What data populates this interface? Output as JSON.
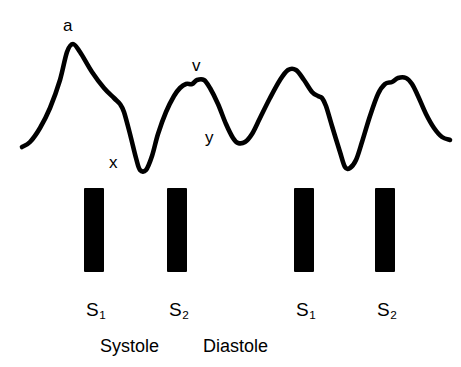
{
  "figure": {
    "type": "jugular-venous-pulse-waveform",
    "width": 461,
    "height": 367,
    "background_color": "#ffffff",
    "stroke_color": "#000000"
  },
  "wave_labels": [
    {
      "id": "a-wave",
      "text": "a",
      "x": 63,
      "y": 17
    },
    {
      "id": "x-descent",
      "text": "x",
      "x": 109,
      "y": 154
    },
    {
      "id": "v-wave",
      "text": "v",
      "x": 192,
      "y": 57
    },
    {
      "id": "y-descent",
      "text": "y",
      "x": 205,
      "y": 129
    }
  ],
  "heart_sounds": [
    {
      "id": "s1-first",
      "label": "S",
      "subscript": "1",
      "bar_x": 84,
      "bar_y": 188,
      "label_x": 86,
      "label_y": 300
    },
    {
      "id": "s2-first",
      "label": "S",
      "subscript": "2",
      "bar_x": 167,
      "bar_y": 188,
      "label_x": 169,
      "label_y": 300
    },
    {
      "id": "s1-second",
      "label": "S",
      "subscript": "1",
      "bar_x": 294,
      "bar_y": 188,
      "label_x": 296,
      "label_y": 300
    },
    {
      "id": "s2-second",
      "label": "S",
      "subscript": "2",
      "bar_x": 375,
      "bar_y": 188,
      "label_x": 377,
      "label_y": 300
    }
  ],
  "phases": [
    {
      "id": "systole",
      "text": "Systole",
      "x": 100,
      "y": 337
    },
    {
      "id": "diastole",
      "text": "Diastole",
      "x": 203,
      "y": 337
    }
  ],
  "chart_data": {
    "type": "line",
    "title": "",
    "xlabel": "",
    "ylabel": "",
    "grid": false,
    "legend": "none",
    "xlim": [
      0,
      461
    ],
    "ylim": [
      180,
      0
    ],
    "series": [
      {
        "name": "jugular-venous-pulse",
        "points": [
          [
            22,
            147
          ],
          [
            30,
            142
          ],
          [
            40,
            128
          ],
          [
            50,
            108
          ],
          [
            60,
            80
          ],
          [
            67,
            52
          ],
          [
            73,
            44
          ],
          [
            80,
            52
          ],
          [
            92,
            72
          ],
          [
            104,
            88
          ],
          [
            114,
            98
          ],
          [
            120,
            104
          ],
          [
            124,
            112
          ],
          [
            130,
            134
          ],
          [
            136,
            158
          ],
          [
            140,
            170
          ],
          [
            146,
            170
          ],
          [
            152,
            156
          ],
          [
            158,
            134
          ],
          [
            166,
            112
          ],
          [
            174,
            96
          ],
          [
            180,
            88
          ],
          [
            186,
            84
          ],
          [
            192,
            84
          ],
          [
            197,
            80
          ],
          [
            204,
            80
          ],
          [
            210,
            88
          ],
          [
            218,
            104
          ],
          [
            226,
            124
          ],
          [
            233,
            138
          ],
          [
            238,
            143
          ],
          [
            245,
            142
          ],
          [
            252,
            134
          ],
          [
            260,
            118
          ],
          [
            270,
            98
          ],
          [
            280,
            80
          ],
          [
            288,
            70
          ],
          [
            296,
            70
          ],
          [
            304,
            80
          ],
          [
            312,
            92
          ],
          [
            318,
            96
          ],
          [
            322,
            98
          ],
          [
            326,
            106
          ],
          [
            332,
            126
          ],
          [
            340,
            152
          ],
          [
            345,
            167
          ],
          [
            350,
            168
          ],
          [
            356,
            160
          ],
          [
            362,
            142
          ],
          [
            370,
            116
          ],
          [
            378,
            94
          ],
          [
            385,
            84
          ],
          [
            392,
            82
          ],
          [
            398,
            78
          ],
          [
            406,
            78
          ],
          [
            412,
            84
          ],
          [
            418,
            96
          ],
          [
            426,
            114
          ],
          [
            434,
            128
          ],
          [
            442,
            137
          ],
          [
            450,
            140
          ]
        ]
      }
    ],
    "annotations": [
      {
        "label": "a",
        "x": 67,
        "y": 44,
        "note": "a wave peak"
      },
      {
        "label": "x",
        "x": 140,
        "y": 170,
        "note": "x descent trough"
      },
      {
        "label": "v",
        "x": 198,
        "y": 80,
        "note": "v wave peak"
      },
      {
        "label": "y",
        "x": 238,
        "y": 143,
        "note": "y descent trough"
      }
    ],
    "event_markers": {
      "name": "heart-sound-bars",
      "x_positions": [
        94,
        177,
        304,
        385
      ],
      "labels": [
        "S1",
        "S2",
        "S1",
        "S2"
      ]
    },
    "phase_spans": [
      "Systole",
      "Diastole"
    ]
  }
}
